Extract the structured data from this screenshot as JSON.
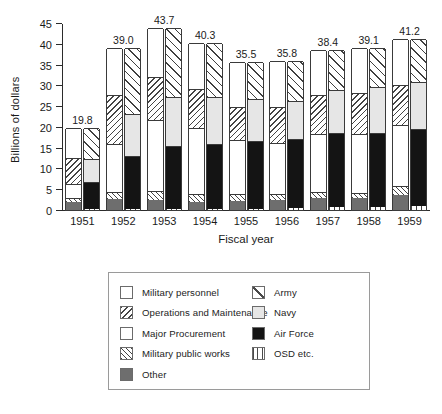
{
  "chart_data": {
    "type": "bar",
    "subtype": "paired-stacked-bar",
    "title": "",
    "xlabel": "Fiscal year",
    "ylabel": "Billions of dollars",
    "ylim": [
      0,
      45
    ],
    "yticks": [
      0,
      5,
      10,
      15,
      20,
      25,
      30,
      35,
      40,
      45
    ],
    "grid": false,
    "legend_position": "below-plot",
    "categories": [
      "1951",
      "1952",
      "1953",
      "1954",
      "1955",
      "1956",
      "1957",
      "1958",
      "1959"
    ],
    "totals": [
      19.8,
      39.0,
      43.7,
      40.3,
      35.5,
      35.8,
      38.4,
      39.1,
      41.2
    ],
    "total_labels": [
      "19.8",
      "39.0",
      "43.7",
      "40.3",
      "35.5",
      "35.8",
      "38.4",
      "39.1",
      "41.2"
    ],
    "bar_pairs": {
      "left_bar_name": "By appropriation",
      "right_bar_name": "By service"
    },
    "series_left": [
      {
        "name": "Other",
        "fill": "solid-gray",
        "values": [
          2.0,
          2.7,
          2.5,
          2.0,
          2.2,
          2.3,
          2.9,
          2.8,
          3.6
        ]
      },
      {
        "name": "Military public works",
        "fill": "fwd-hatch",
        "values": [
          0.9,
          1.6,
          2.1,
          1.8,
          1.7,
          1.6,
          1.4,
          1.3,
          2.2
        ]
      },
      {
        "name": "Major Procurement",
        "fill": "dots",
        "values": [
          3.3,
          11.5,
          17.0,
          15.9,
          13.0,
          12.2,
          13.9,
          14.1,
          14.7
        ]
      },
      {
        "name": "Operations and Maintenance",
        "fill": "back-hatch",
        "values": [
          6.4,
          11.9,
          10.3,
          9.5,
          7.8,
          8.6,
          9.4,
          9.9,
          9.6
        ]
      },
      {
        "name": "Military personnel",
        "fill": "white",
        "values": [
          7.2,
          11.3,
          11.8,
          11.1,
          10.8,
          11.1,
          10.8,
          11.0,
          11.1
        ]
      }
    ],
    "series_right": [
      {
        "name": "OSD etc.",
        "fill": "vert-lines",
        "values": [
          0.2,
          0.2,
          0.2,
          0.3,
          0.3,
          0.4,
          0.7,
          0.8,
          0.9
        ]
      },
      {
        "name": "Air Force",
        "fill": "solid-black",
        "values": [
          6.5,
          12.8,
          15.2,
          15.5,
          16.4,
          16.7,
          17.8,
          17.7,
          18.6
        ]
      },
      {
        "name": "Navy",
        "fill": "light-gray",
        "values": [
          5.5,
          10.2,
          11.8,
          11.4,
          9.9,
          9.2,
          10.4,
          11.1,
          11.3
        ]
      },
      {
        "name": "Army",
        "fill": "diag-hatch",
        "values": [
          7.6,
          15.8,
          16.5,
          13.1,
          8.9,
          9.5,
          9.5,
          9.5,
          10.4
        ]
      }
    ]
  },
  "legend": {
    "left_column": [
      {
        "label": "Military personnel",
        "fill": "white"
      },
      {
        "label": "Operations and Maintenance",
        "fill": "back-hatch"
      },
      {
        "label": "Major Procurement",
        "fill": "dots"
      },
      {
        "label": "Military public works",
        "fill": "fwd-hatch"
      },
      {
        "label": "Other",
        "fill": "solid-gray"
      }
    ],
    "right_column": [
      {
        "label": "Army",
        "fill": "diag-hatch"
      },
      {
        "label": "Navy",
        "fill": "light-gray"
      },
      {
        "label": "Air Force",
        "fill": "solid-black"
      },
      {
        "label": "OSD etc.",
        "fill": "vert-lines"
      }
    ]
  }
}
